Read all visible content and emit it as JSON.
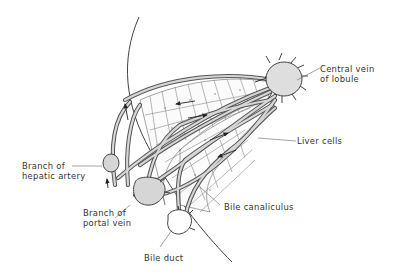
{
  "diagram": {
    "colors": {
      "line": "#444444",
      "vessel_fill": "#d6d6d6",
      "vein_fill": "#dedede",
      "background": "#ffffff",
      "text": "#333333"
    },
    "labels": {
      "central_vein_line1": "Central vein",
      "central_vein_line2": "of lobule",
      "liver_cells": "Liver cells",
      "hepatic_artery_line1": "Branch of",
      "hepatic_artery_line2": "hepatic artery",
      "bile_canaliculus": "Bile canaliculus",
      "portal_vein_line1": "Branch of",
      "portal_vein_line2": "portal vein",
      "bile_duct": "Bile duct"
    },
    "nodes": [
      {
        "id": "central-vein",
        "label": "Central vein of lobule"
      },
      {
        "id": "hepatic-artery",
        "label": "Branch of hepatic artery"
      },
      {
        "id": "portal-vein",
        "label": "Branch of portal vein"
      },
      {
        "id": "bile-duct",
        "label": "Bile duct"
      },
      {
        "id": "liver-cells",
        "label": "Liver cells"
      },
      {
        "id": "bile-canaliculus",
        "label": "Bile canaliculus"
      }
    ],
    "edges": [
      {
        "from": "portal-vein",
        "to": "central-vein",
        "type": "blood flow (sinusoid)"
      },
      {
        "from": "hepatic-artery",
        "to": "central-vein",
        "type": "blood flow (sinusoid)"
      },
      {
        "from": "liver-cells",
        "to": "bile-duct",
        "type": "bile flow (canaliculus)"
      }
    ]
  }
}
